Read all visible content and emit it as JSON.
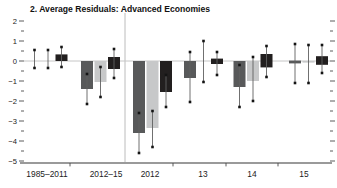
{
  "title": "2. Average Residuals: Advanced Economies",
  "colors": {
    "dark_series": "#58595a",
    "light_series": "#c7c8c9",
    "black_series": "#221f1f",
    "axis_line": "#9a9a9a",
    "zero_line": "#c6c6c6",
    "separator_line": "#bcbcbc",
    "tick": "#4a4a4a",
    "whisker": "#606060",
    "marker": "#141414",
    "label_text": "#222222",
    "title_text": "#111111"
  },
  "chart_data": {
    "type": "bar",
    "title": "2. Average Residuals: Advanced Economies",
    "categories": [
      "1985–2011",
      "2012–15",
      "2012",
      "13",
      "14",
      "15"
    ],
    "xlabel": "",
    "ylabel": "",
    "ylim": [
      -5,
      2
    ],
    "ytick_interval": 1,
    "yminor_interval": 0.5,
    "grid": false,
    "legend_position": "none",
    "zero_line": true,
    "separator_after_category_index": 1,
    "note": "each bar has a confidence whisker with square end markers; values in residual units",
    "series": [
      {
        "name": "dark-gray",
        "color_key": "dark_series",
        "bars": [
          {
            "bar_top": 0,
            "bar_bottom": -0.05,
            "ci_top": 0.55,
            "ci_bottom": -0.35
          },
          {
            "bar_top": 0,
            "bar_bottom": -1.4,
            "ci_top": -0.65,
            "ci_bottom": -2.15
          },
          {
            "bar_top": 0,
            "bar_bottom": -3.6,
            "ci_top": -2.6,
            "ci_bottom": -4.6
          },
          {
            "bar_top": 0,
            "bar_bottom": -0.85,
            "ci_top": 0.45,
            "ci_bottom": -2.05
          },
          {
            "bar_top": 0,
            "bar_bottom": -1.3,
            "ci_top": -0.2,
            "ci_bottom": -2.3
          },
          {
            "bar_top": 0.02,
            "bar_bottom": -0.12,
            "ci_top": 0.85,
            "ci_bottom": -1.1
          }
        ]
      },
      {
        "name": "light-gray",
        "color_key": "light_series",
        "bars": [
          {
            "bar_top": 0,
            "bar_bottom": -0.05,
            "ci_top": 0.55,
            "ci_bottom": -0.35
          },
          {
            "bar_top": 0,
            "bar_bottom": -1.05,
            "ci_top": -0.3,
            "ci_bottom": -1.8
          },
          {
            "bar_top": 0,
            "bar_bottom": -3.35,
            "ci_top": -2.5,
            "ci_bottom": -4.3
          },
          {
            "bar_top": 0,
            "bar_bottom": -0.05,
            "ci_top": 1.0,
            "ci_bottom": -1.05
          },
          {
            "bar_top": 0,
            "bar_bottom": -1.0,
            "ci_top": 0.2,
            "ci_bottom": -2.0
          },
          {
            "bar_top": 0,
            "bar_bottom": -0.08,
            "ci_top": 0.8,
            "ci_bottom": -1.1
          }
        ]
      },
      {
        "name": "black",
        "color_key": "black_series",
        "bars": [
          {
            "bar_top": 0.33,
            "bar_bottom": 0,
            "ci_top": 0.7,
            "ci_bottom": -0.3
          },
          {
            "bar_top": 0.2,
            "bar_bottom": -0.4,
            "ci_top": 0.6,
            "ci_bottom": -0.85
          },
          {
            "bar_top": 0,
            "bar_bottom": -1.55,
            "ci_top": -0.7,
            "ci_bottom": -2.3
          },
          {
            "bar_top": 0.12,
            "bar_bottom": -0.15,
            "ci_top": 0.45,
            "ci_bottom": -0.7
          },
          {
            "bar_top": 0.35,
            "bar_bottom": -0.32,
            "ci_top": 0.75,
            "ci_bottom": -0.8
          },
          {
            "bar_top": 0.24,
            "bar_bottom": -0.19,
            "ci_top": 0.8,
            "ci_bottom": -0.6
          }
        ]
      }
    ]
  }
}
